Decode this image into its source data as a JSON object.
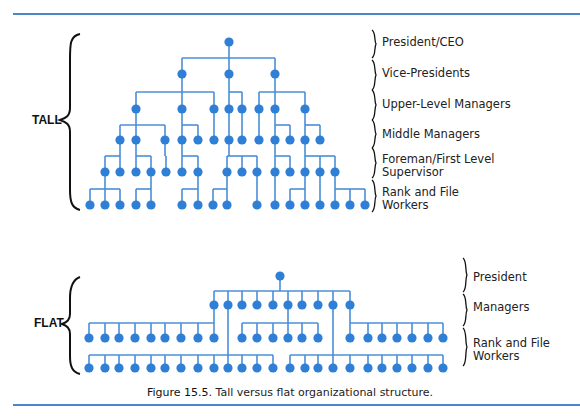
{
  "figure": {
    "caption_number": "Figure 15.5.",
    "caption_text": " Tall versus flat organizational structure.",
    "colors": {
      "node": "#2f7fd6",
      "line": "#4a8fd8",
      "rule": "#4a86c8",
      "bracket": "#111111"
    }
  },
  "tall": {
    "side_label": "TALL",
    "levels": [
      {
        "label": "President/CEO",
        "y": 36
      },
      {
        "label": "Vice-Presidents",
        "y": 67
      },
      {
        "label": "Upper-Level Managers",
        "y": 98
      },
      {
        "label": "Middle Managers",
        "y": 128
      },
      {
        "label": "Foreman/First Level\nSupervisor",
        "y": 152
      },
      {
        "label": "Rank and File\nWorkers",
        "y": 185
      }
    ],
    "rows_y": [
      42,
      74,
      109,
      140,
      172,
      205
    ],
    "groups": [
      {
        "parent": [
          229,
          42
        ],
        "bar_y": 58,
        "children_row": 1,
        "children": [
          182,
          229,
          275
        ]
      },
      {
        "parent": [
          182,
          74
        ],
        "bar_y": 92,
        "children_row": 2,
        "children": [
          136,
          182,
          214
        ]
      },
      {
        "parent": [
          229,
          74
        ],
        "bar_y": 92,
        "children_row": 2,
        "children": [
          229,
          242
        ]
      },
      {
        "parent": [
          275,
          74
        ],
        "bar_y": 92,
        "children_row": 2,
        "children": [
          259,
          275,
          305
        ]
      },
      {
        "parent": [
          136,
          109
        ],
        "bar_y": 125,
        "children_row": 3,
        "children": [
          120,
          136,
          165
        ]
      },
      {
        "parent": [
          182,
          109
        ],
        "bar_y": 125,
        "children_row": 3,
        "children": [
          182,
          198
        ]
      },
      {
        "parent": [
          214,
          109
        ],
        "bar_y": 125,
        "children_row": 3,
        "children": [
          214
        ]
      },
      {
        "parent": [
          229,
          109
        ],
        "bar_y": 125,
        "children_row": 3,
        "children": [
          229
        ]
      },
      {
        "parent": [
          242,
          109
        ],
        "bar_y": 125,
        "children_row": 3,
        "children": [
          242
        ]
      },
      {
        "parent": [
          259,
          109
        ],
        "bar_y": 125,
        "children_row": 3,
        "children": [
          259
        ]
      },
      {
        "parent": [
          275,
          109
        ],
        "bar_y": 125,
        "children_row": 3,
        "children": [
          275,
          290
        ]
      },
      {
        "parent": [
          305,
          109
        ],
        "bar_y": 125,
        "children_row": 3,
        "children": [
          305,
          320
        ]
      },
      {
        "parent": [
          120,
          140
        ],
        "bar_y": 156,
        "children_row": 4,
        "children": [
          105,
          120
        ]
      },
      {
        "parent": [
          136,
          140
        ],
        "bar_y": 156,
        "children_row": 4,
        "children": [
          136,
          151
        ]
      },
      {
        "parent": [
          165,
          140
        ],
        "bar_y": 156,
        "children_row": 4,
        "children": [
          166
        ]
      },
      {
        "parent": [
          182,
          140
        ],
        "bar_y": 156,
        "children_row": 4,
        "children": [
          182,
          198
        ]
      },
      {
        "parent": [
          229,
          140
        ],
        "bar_y": 156,
        "children_row": 4,
        "children": [
          227,
          242,
          257
        ]
      },
      {
        "parent": [
          275,
          140
        ],
        "bar_y": 156,
        "children_row": 4,
        "children": [
          275,
          290
        ]
      },
      {
        "parent": [
          305,
          140
        ],
        "bar_y": 156,
        "children_row": 4,
        "children": [
          305,
          320,
          335
        ]
      },
      {
        "parent": [
          105,
          172
        ],
        "bar_y": 189,
        "children_row": 5,
        "children": [
          90,
          105,
          120
        ]
      },
      {
        "parent": [
          151,
          172
        ],
        "bar_y": 189,
        "children_row": 5,
        "children": [
          136,
          151
        ]
      },
      {
        "parent": [
          198,
          172
        ],
        "bar_y": 189,
        "children_row": 5,
        "children": [
          182,
          198
        ]
      },
      {
        "parent": [
          227,
          172
        ],
        "bar_y": 189,
        "children_row": 5,
        "children": [
          213,
          227
        ]
      },
      {
        "parent": [
          257,
          172
        ],
        "bar_y": 189,
        "children_row": 5,
        "children": [
          257
        ]
      },
      {
        "parent": [
          275,
          172
        ],
        "bar_y": 189,
        "children_row": 5,
        "children": [
          275
        ]
      },
      {
        "parent": [
          305,
          172
        ],
        "bar_y": 189,
        "children_row": 5,
        "children": [
          290,
          305
        ]
      },
      {
        "parent": [
          320,
          172
        ],
        "bar_y": 189,
        "children_row": 5,
        "children": [
          320
        ]
      },
      {
        "parent": [
          335,
          172
        ],
        "bar_y": 189,
        "children_row": 5,
        "children": [
          335,
          350,
          365
        ]
      }
    ]
  },
  "flat": {
    "side_label": "FLAT",
    "levels": [
      {
        "label": "President",
        "y": 270
      },
      {
        "label": "Managers",
        "y": 302
      },
      {
        "label": "Rank and File\nWorkers",
        "y": 338
      }
    ],
    "rows_y": [
      276,
      305,
      338,
      368
    ],
    "groups": [
      {
        "parent": [
          280,
          276
        ],
        "bar_y": 291,
        "children_row": 1,
        "children": [
          214,
          228,
          242,
          257,
          273,
          288,
          302,
          318,
          333,
          350
        ]
      },
      {
        "parent": [
          214,
          305
        ],
        "bar_y": 323,
        "children_row": 2,
        "children": [
          89,
          105,
          119,
          135,
          151,
          165,
          181,
          198,
          214
        ]
      },
      {
        "parent": [
          288,
          305
        ],
        "bar_y": 323,
        "children_row": 2,
        "children": [
          242,
          257,
          273,
          288,
          302,
          318
        ]
      },
      {
        "parent": [
          350,
          305
        ],
        "bar_y": 323,
        "children_row": 2,
        "children": [
          350,
          368,
          382,
          397,
          412,
          428,
          443
        ]
      },
      {
        "parent": [
          228,
          305
        ],
        "bar_y": 355,
        "children_row": 3,
        "children": [
          89,
          105,
          119,
          135,
          151,
          165,
          181,
          198,
          214,
          228,
          242,
          257,
          273
        ]
      },
      {
        "parent": [
          333,
          305
        ],
        "bar_y": 355,
        "children_row": 3,
        "children": [
          290,
          305,
          318,
          333,
          350,
          368,
          382,
          397,
          412,
          428,
          443
        ]
      }
    ]
  }
}
